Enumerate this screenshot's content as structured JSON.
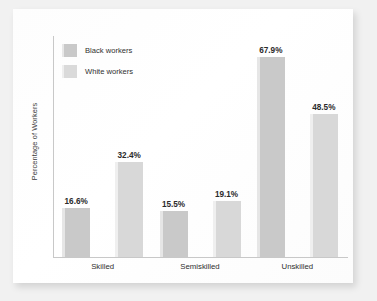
{
  "chart_data": {
    "type": "bar",
    "title": "",
    "subtitle": "",
    "xlabel": "",
    "ylabel": "Percentage of Workers",
    "categories": [
      "Skilled",
      "Semiskilled",
      "Unskilled"
    ],
    "series": [
      {
        "name": "Black workers",
        "color": "#c9c9c9",
        "values": [
          16.6,
          15.5,
          67.9
        ],
        "labels": [
          "16.6%",
          "15.5%",
          "67.9%"
        ]
      },
      {
        "name": "White workers",
        "color": "#d8d8d8",
        "values": [
          32.4,
          19.1,
          48.5
        ],
        "labels": [
          "32.4%",
          "19.1%",
          "48.5%"
        ]
      }
    ],
    "ylim": [
      0,
      75
    ],
    "grid": false,
    "y_tick_labels": [],
    "legend_position": "top-left"
  },
  "legend": {
    "items": [
      {
        "label": "Black workers",
        "swatch": "legend-swatch-black-workers"
      },
      {
        "label": "White workers",
        "swatch": "legend-swatch-white-workers"
      }
    ]
  },
  "axes": {
    "y_title": "Percentage of Workers"
  }
}
